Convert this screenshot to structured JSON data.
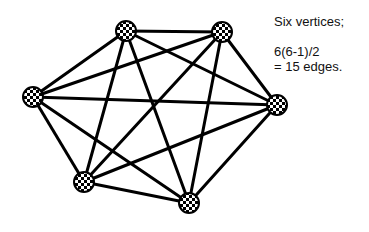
{
  "diagram": {
    "type": "complete-graph",
    "name": "K6",
    "vertices": [
      {
        "id": "v1",
        "label": "top-left",
        "x": 126,
        "y": 31
      },
      {
        "id": "v2",
        "label": "top-right",
        "x": 222,
        "y": 32
      },
      {
        "id": "v3",
        "label": "left",
        "x": 33,
        "y": 97
      },
      {
        "id": "v4",
        "label": "right",
        "x": 277,
        "y": 105
      },
      {
        "id": "v5",
        "label": "bottom-left",
        "x": 84,
        "y": 182
      },
      {
        "id": "v6",
        "label": "bottom-right",
        "x": 189,
        "y": 203
      }
    ],
    "edge_count": 15,
    "vertex_radius": 10,
    "edge_color": "#000000",
    "edge_width": 3
  },
  "caption": {
    "line1": "Six vertices;",
    "line2": "6(6-1)/2",
    "line3": "= 15 edges."
  }
}
